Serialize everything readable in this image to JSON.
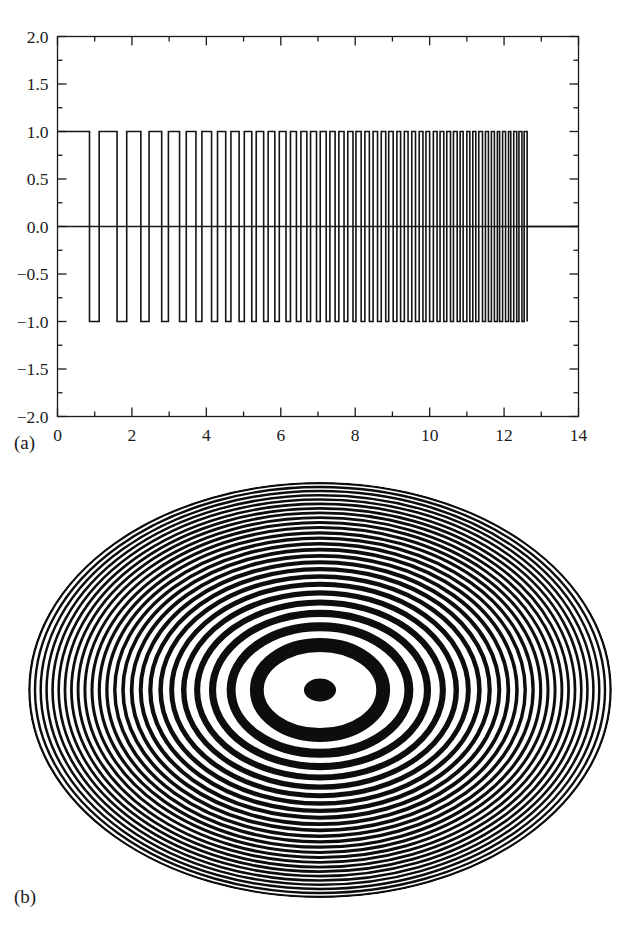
{
  "figure": {
    "panels": [
      {
        "id": "a",
        "label": "(a)"
      },
      {
        "id": "b",
        "label": "(b)"
      }
    ]
  },
  "chart_data": [
    {
      "type": "line",
      "panel": "(a)",
      "title": "",
      "subtitle": "",
      "xlabel": "",
      "ylabel": "",
      "grid": false,
      "legend": null,
      "xlim": [
        0,
        14
      ],
      "ylim": [
        -2.0,
        2.0
      ],
      "xticks": [
        0,
        2,
        4,
        6,
        8,
        10,
        12,
        14
      ],
      "xtick_labels": [
        "0",
        "2",
        "4",
        "6",
        "8",
        "10",
        "12",
        "14"
      ],
      "xminor_step": 1,
      "yticks": [
        -2.0,
        -1.5,
        -1.0,
        -0.5,
        0.0,
        0.5,
        1.0,
        1.5,
        2.0
      ],
      "ytick_labels": [
        "-2.0",
        "-1.5",
        "-1.0",
        "-0.5",
        "0.0",
        "0.5",
        "1.0",
        "1.5",
        "2.0"
      ],
      "ytick_display": [
        "−2.0",
        "−1.5",
        "−1.0",
        "−0.5",
        "0.0",
        "0.5",
        "1.0",
        "1.5",
        "2.0"
      ],
      "yminor_step": 0.25,
      "description": "Binary square-wave chirp: amplitude alternates between +1 and -1 with monotonically decreasing dwell time (increasing frequency) from x=0 to x=12.6, then flat at 0.",
      "line_color": "#141414",
      "line_width": 1.6,
      "series": [
        {
          "name": "square-wave chirp",
          "kind": "step",
          "amplitude_high": 1.0,
          "amplitude_low": -1.0,
          "start_x": 0.0,
          "end_x": 12.62,
          "tail_value": 0.0,
          "transitions": [
            0.0,
            0.86,
            1.12,
            1.6,
            1.86,
            2.24,
            2.46,
            2.8,
            2.98,
            3.28,
            3.46,
            3.72,
            3.88,
            4.14,
            4.3,
            4.52,
            4.66,
            4.88,
            5.02,
            5.22,
            5.34,
            5.54,
            5.66,
            5.84,
            5.96,
            6.14,
            6.26,
            6.42,
            6.54,
            6.7,
            6.8,
            6.96,
            7.06,
            7.22,
            7.32,
            7.46,
            7.56,
            7.7,
            7.8,
            7.94,
            8.02,
            8.16,
            8.26,
            8.38,
            8.48,
            8.6,
            8.7,
            8.82,
            8.9,
            9.02,
            9.12,
            9.22,
            9.32,
            9.42,
            9.52,
            9.62,
            9.72,
            9.82,
            9.9,
            10.0,
            10.1,
            10.2,
            10.28,
            10.38,
            10.46,
            10.56,
            10.64,
            10.74,
            10.82,
            10.9,
            11.0,
            11.08,
            11.16,
            11.24,
            11.32,
            11.42,
            11.5,
            11.58,
            11.66,
            11.74,
            11.82,
            11.88,
            11.96,
            12.04,
            12.12,
            12.18,
            12.26,
            12.34,
            12.4,
            12.48,
            12.54,
            12.62
          ],
          "first_level": 1.0
        }
      ]
    },
    {
      "type": "heatmap",
      "panel": "(b)",
      "title": "",
      "xlabel": "",
      "ylabel": "",
      "grid": false,
      "legend": null,
      "description": "Two-dimensional binary zone plate (radial chirp). Concentric elliptical black/white rings with ring period decreasing as radius increases; solid black disc at the centre.",
      "colors": {
        "ring_dark": "#0d0d0d",
        "ring_light": "#ffffff"
      },
      "center_px": [
        320,
        220
      ],
      "radius_x_px": 292,
      "radius_y_px": 208,
      "core_radius_frac": 0.055,
      "ring_count": 25,
      "chirp_exponent": 0.5
    }
  ]
}
